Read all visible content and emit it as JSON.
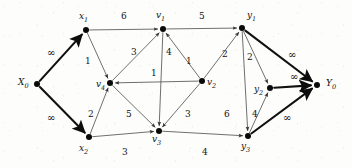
{
  "figure": {
    "width": 352,
    "height": 168,
    "background_color": "#fdfdfb",
    "thin_edge_color": "#555555",
    "thick_edge_color": "#111111",
    "node_color": "#0a0a0a"
  },
  "nodes": [
    {
      "id": "X0",
      "label": "X",
      "sub": "0",
      "x": 37,
      "y": 84,
      "label_x": 18,
      "label_y": 78
    },
    {
      "id": "x1",
      "label": "x",
      "sub": "1",
      "x": 86,
      "y": 30,
      "label_x": 79,
      "label_y": 12
    },
    {
      "id": "x2",
      "label": "x",
      "sub": "2",
      "x": 89,
      "y": 137,
      "label_x": 79,
      "label_y": 144
    },
    {
      "id": "v4",
      "label": "v",
      "sub": "4",
      "x": 110,
      "y": 83,
      "label_x": 96,
      "label_y": 80
    },
    {
      "id": "v1",
      "label": "v",
      "sub": "1",
      "x": 163,
      "y": 29,
      "label_x": 156,
      "label_y": 11
    },
    {
      "id": "v2",
      "label": "v",
      "sub": "2",
      "x": 202,
      "y": 81,
      "label_x": 207,
      "label_y": 78
    },
    {
      "id": "v3",
      "label": "v",
      "sub": "3",
      "x": 159,
      "y": 131,
      "label_x": 152,
      "label_y": 135
    },
    {
      "id": "y1",
      "label": "y",
      "sub": "1",
      "x": 242,
      "y": 28,
      "label_x": 247,
      "label_y": 11
    },
    {
      "id": "y2",
      "label": "y",
      "sub": "2",
      "x": 270,
      "y": 88,
      "label_x": 254,
      "label_y": 85
    },
    {
      "id": "y3",
      "label": "y",
      "sub": "3",
      "x": 248,
      "y": 136,
      "label_x": 241,
      "label_y": 142
    },
    {
      "id": "Y0",
      "label": "Y",
      "sub": "0",
      "x": 317,
      "y": 85,
      "label_x": 326,
      "label_y": 79
    }
  ],
  "edges": [
    {
      "id": "X0-x1",
      "from": "X0",
      "to": "x1",
      "capacity": "∞",
      "weight": "thick",
      "label_x": 47,
      "label_y": 48,
      "is_infinity": true
    },
    {
      "id": "X0-x2",
      "from": "X0",
      "to": "x2",
      "capacity": "∞",
      "weight": "thick",
      "label_x": 47,
      "label_y": 113,
      "is_infinity": true
    },
    {
      "id": "x1-v1",
      "from": "x1",
      "to": "v1",
      "capacity": "6",
      "weight": "thin",
      "label_x": 121,
      "label_y": 12,
      "is_infinity": false
    },
    {
      "id": "x1-v4",
      "from": "x1",
      "to": "v4",
      "capacity": "1",
      "weight": "thin",
      "label_x": 85,
      "label_y": 57,
      "is_infinity": false
    },
    {
      "id": "x2-v4",
      "from": "x2",
      "to": "v4",
      "capacity": "2",
      "weight": "thin",
      "label_x": 88,
      "label_y": 110,
      "is_infinity": false
    },
    {
      "id": "x2-v3",
      "from": "x2",
      "to": "v3",
      "capacity": "3",
      "weight": "thin",
      "label_x": 122,
      "label_y": 148,
      "is_infinity": false
    },
    {
      "id": "v4-v1",
      "from": "v4",
      "to": "v1",
      "capacity": "3",
      "weight": "thin",
      "label_x": 131,
      "label_y": 48,
      "is_infinity": false
    },
    {
      "id": "v4-v3",
      "from": "v4",
      "to": "v3",
      "capacity": "5",
      "weight": "thin",
      "label_x": 126,
      "label_y": 110,
      "is_infinity": false
    },
    {
      "id": "v2-v4",
      "from": "v2",
      "to": "v4",
      "capacity": "1",
      "weight": "thin",
      "label_x": 151,
      "label_y": 69,
      "is_infinity": false
    },
    {
      "id": "v1-v3",
      "from": "v1",
      "to": "v3",
      "capacity": "4",
      "weight": "thin",
      "label_x": 166,
      "label_y": 48,
      "is_infinity": false
    },
    {
      "id": "v2-v1",
      "from": "v2",
      "to": "v1",
      "capacity": "1",
      "weight": "thin",
      "label_x": 186,
      "label_y": 57,
      "is_infinity": false
    },
    {
      "id": "v1-y1",
      "from": "v1",
      "to": "y1",
      "capacity": "5",
      "weight": "thin",
      "label_x": 199,
      "label_y": 12,
      "is_infinity": false
    },
    {
      "id": "v2-v3",
      "from": "v2",
      "to": "v3",
      "capacity": "3",
      "weight": "thin",
      "label_x": 185,
      "label_y": 110,
      "is_infinity": false
    },
    {
      "id": "v2-y1",
      "from": "v2",
      "to": "y1",
      "capacity": "2",
      "weight": "thin",
      "label_x": 222,
      "label_y": 50,
      "is_infinity": false
    },
    {
      "id": "v3-y3",
      "from": "v3",
      "to": "y3",
      "capacity": "4",
      "weight": "thin",
      "label_x": 202,
      "label_y": 148,
      "is_infinity": false
    },
    {
      "id": "y1-y2",
      "from": "y1",
      "to": "y2",
      "capacity": "2",
      "weight": "thin",
      "label_x": 247,
      "label_y": 53,
      "is_infinity": false
    },
    {
      "id": "y1-y3",
      "from": "y1",
      "to": "y3",
      "capacity": "6",
      "weight": "thin",
      "label_x": 224,
      "label_y": 110,
      "is_infinity": false
    },
    {
      "id": "y3-y2",
      "from": "y3",
      "to": "y2",
      "capacity": "4",
      "weight": "thin",
      "label_x": 252,
      "label_y": 110,
      "is_infinity": false
    },
    {
      "id": "y1-Y0",
      "from": "y1",
      "to": "Y0",
      "capacity": "∞",
      "weight": "thick",
      "label_x": 288,
      "label_y": 50,
      "is_infinity": true
    },
    {
      "id": "y2-Y0",
      "from": "y2",
      "to": "Y0",
      "capacity": "∞",
      "weight": "thick",
      "label_x": 290,
      "label_y": 72,
      "is_infinity": true
    },
    {
      "id": "y3-Y0",
      "from": "y3",
      "to": "Y0",
      "capacity": "∞",
      "weight": "thick",
      "label_x": 283,
      "label_y": 113,
      "is_infinity": true
    }
  ]
}
